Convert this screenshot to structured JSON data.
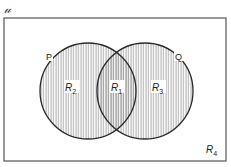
{
  "diagram": {
    "type": "venn",
    "universe_label": "υ",
    "universe_label_display": "U",
    "sets": [
      {
        "name": "P",
        "label": "P",
        "cx": 88,
        "cy": 91,
        "r": 48
      },
      {
        "name": "Q",
        "label": "Q",
        "cx": 145,
        "cy": 91,
        "r": 48
      }
    ],
    "regions": [
      {
        "id": "R1",
        "base": "R",
        "sub": "1",
        "description": "P ∩ Q"
      },
      {
        "id": "R2",
        "base": "R",
        "sub": "2",
        "description": "P only"
      },
      {
        "id": "R3",
        "base": "R",
        "sub": "3",
        "description": "Q only"
      },
      {
        "id": "R4",
        "base": "R",
        "sub": "4",
        "description": "outside P and Q"
      }
    ],
    "colors": {
      "outline": "#2a2a2a",
      "hatch": "#8a8a8a",
      "background": "#ffffff",
      "border": "#555555"
    }
  }
}
